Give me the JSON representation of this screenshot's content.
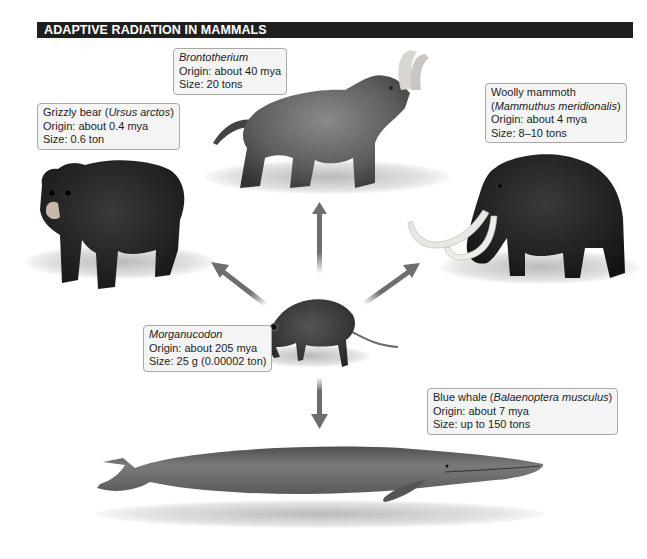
{
  "title": "ADAPTIVE RADIATION IN MAMMALS",
  "colors": {
    "title_bar_bg": "#1f1f1f",
    "title_text": "#ffffff",
    "label_bg": "#f4f4f4",
    "label_border": "#a8a8a8",
    "arrow": "#6e6e6e"
  },
  "ancestor": {
    "icon": "morganucodon-illustration",
    "name": "Morganucodon",
    "name_italic": true,
    "origin": "Origin: about 205 mya",
    "size": "Size: 25 g (0.00002 ton)"
  },
  "descendants": [
    {
      "icon": "brontotherium-illustration",
      "name": "Brontotherium",
      "name_italic": true,
      "origin": "Origin: about 40 mya",
      "size": "Size: 20 tons",
      "arrow_direction": "up"
    },
    {
      "icon": "grizzly-bear-illustration",
      "common_name": "Grizzly bear (",
      "scientific_name": "Ursus arctos",
      "close": ")",
      "origin": "Origin: about 0.4 mya",
      "size": "Size: 0.6 ton",
      "arrow_direction": "up-left"
    },
    {
      "icon": "woolly-mammoth-illustration",
      "common_name": "Woolly mammoth",
      "open": "(",
      "scientific_name": "Mammuthus meridionalis",
      "close": ")",
      "origin": "Origin: about 4 mya",
      "size": "Size: 8–10 tons",
      "arrow_direction": "up-right"
    },
    {
      "icon": "blue-whale-illustration",
      "common_name": "Blue whale (",
      "scientific_name": "Balaenoptera musculus",
      "close": ")",
      "origin": "Origin: about 7 mya",
      "size": "Size: up to 150 tons",
      "arrow_direction": "down"
    }
  ]
}
